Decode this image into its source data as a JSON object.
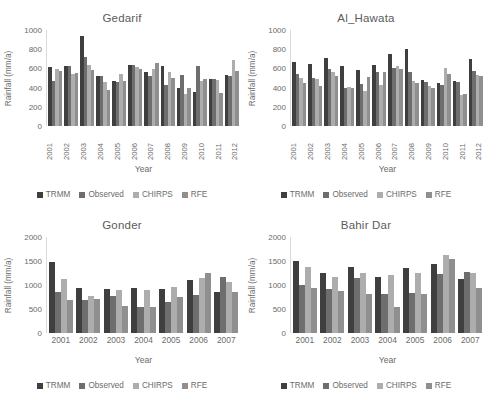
{
  "figure": {
    "axis_label_y": "Rainfall (mm/a)",
    "axis_label_x": "Year",
    "series_names": [
      "TRMM",
      "Observed",
      "CHIRPS",
      "RFE"
    ],
    "series_colors": [
      "#3f3f3f",
      "#6e6e6e",
      "#adadad",
      "#8f8f8f"
    ]
  },
  "chart_data": [
    {
      "type": "bar",
      "title": "Gedarif",
      "xlabel": "Year",
      "ylabel": "Rainfall (mm/a)",
      "ylim": [
        0,
        1000
      ],
      "yticks": [
        0,
        200,
        400,
        600,
        800,
        1000
      ],
      "grid": false,
      "legend_position": "bottom",
      "categories": [
        "2001",
        "2002",
        "2003",
        "2004",
        "2005",
        "2006",
        "2007",
        "2008",
        "2009",
        "2010",
        "2011",
        "2012"
      ],
      "series": [
        {
          "name": "TRMM",
          "values": [
            610,
            630,
            940,
            520,
            470,
            640,
            560,
            630,
            400,
            350,
            490,
            530
          ]
        },
        {
          "name": "Observed",
          "values": [
            470,
            620,
            720,
            520,
            460,
            640,
            520,
            430,
            530,
            630,
            490,
            520
          ]
        },
        {
          "name": "CHIRPS",
          "values": [
            590,
            540,
            640,
            460,
            540,
            610,
            590,
            560,
            330,
            470,
            480,
            690
          ]
        },
        {
          "name": "RFE",
          "values": [
            570,
            550,
            580,
            380,
            470,
            590,
            660,
            500,
            400,
            490,
            340,
            570
          ]
        }
      ]
    },
    {
      "type": "bar",
      "title": "Al_Hawata",
      "xlabel": "Year",
      "ylabel": "Rainfall (mm/a)",
      "ylim": [
        0,
        1000
      ],
      "yticks": [
        0,
        200,
        400,
        600,
        800,
        1000
      ],
      "grid": false,
      "legend_position": "bottom",
      "categories": [
        "2001",
        "2002",
        "2003",
        "2004",
        "2005",
        "2006",
        "2007",
        "2008",
        "2009",
        "2010",
        "2011",
        "2012"
      ],
      "series": [
        {
          "name": "TRMM",
          "values": [
            670,
            650,
            710,
            620,
            580,
            640,
            750,
            800,
            480,
            450,
            470,
            700
          ]
        },
        {
          "name": "Observed",
          "values": [
            540,
            500,
            590,
            400,
            440,
            560,
            600,
            560,
            460,
            430,
            460,
            570
          ]
        },
        {
          "name": "CHIRPS",
          "values": [
            500,
            490,
            560,
            410,
            360,
            430,
            620,
            470,
            420,
            600,
            320,
            530
          ]
        },
        {
          "name": "RFE",
          "values": [
            450,
            420,
            520,
            400,
            510,
            560,
            590,
            450,
            400,
            540,
            330,
            520
          ]
        }
      ]
    },
    {
      "type": "bar",
      "title": "Gonder",
      "xlabel": "Year",
      "ylabel": "Rainfall (mm/a)",
      "ylim": [
        0,
        2000
      ],
      "yticks": [
        0,
        500,
        1000,
        1500,
        2000
      ],
      "grid": false,
      "legend_position": "bottom",
      "categories": [
        "2001",
        "2002",
        "2003",
        "2004",
        "2005",
        "2006",
        "2007"
      ],
      "series": [
        {
          "name": "TRMM",
          "values": [
            1480,
            930,
            920,
            940,
            910,
            1100,
            860
          ]
        },
        {
          "name": "Observed",
          "values": [
            860,
            690,
            770,
            550,
            650,
            790,
            1170
          ]
        },
        {
          "name": "CHIRPS",
          "values": [
            1120,
            780,
            900,
            890,
            960,
            1140,
            1060
          ]
        },
        {
          "name": "RFE",
          "values": [
            680,
            700,
            560,
            540,
            760,
            1260,
            860
          ]
        }
      ]
    },
    {
      "type": "bar",
      "title": "Bahir Dar",
      "xlabel": "Year",
      "ylabel": "Rainfall (mm/a)",
      "ylim": [
        0,
        2000
      ],
      "yticks": [
        0,
        500,
        1000,
        1500,
        2000
      ],
      "grid": false,
      "legend_position": "bottom",
      "categories": [
        "2001",
        "2002",
        "2003",
        "2004",
        "2005",
        "2006",
        "2007"
      ],
      "series": [
        {
          "name": "TRMM",
          "values": [
            1490,
            1260,
            1370,
            1160,
            1360,
            1430,
            1120
          ]
        },
        {
          "name": "Observed",
          "values": [
            1000,
            920,
            1150,
            820,
            830,
            1220,
            1280
          ]
        },
        {
          "name": "CHIRPS",
          "values": [
            1380,
            1170,
            1250,
            1210,
            1240,
            1620,
            1260
          ]
        },
        {
          "name": "RFE",
          "values": [
            930,
            880,
            820,
            540,
            810,
            1550,
            930
          ]
        }
      ]
    }
  ]
}
